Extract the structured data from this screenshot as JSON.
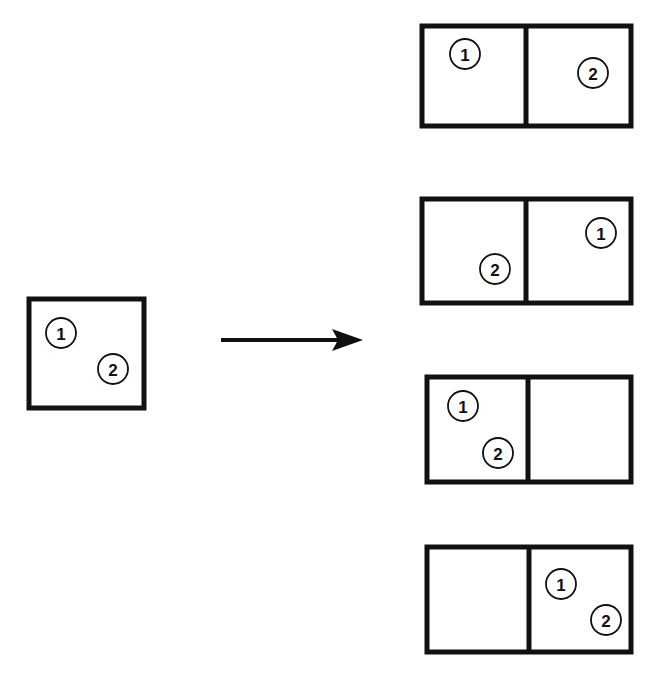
{
  "diagram": {
    "type": "state-transition",
    "source": {
      "label": "single-cell",
      "particles": [
        {
          "id": "1",
          "label": "1",
          "cx": 61,
          "cy": 333
        },
        {
          "id": "2",
          "label": "2",
          "cx": 113,
          "cy": 369
        }
      ]
    },
    "arrow": {
      "from": "source",
      "to": "outcomes",
      "direction": "right"
    },
    "outcomes": [
      {
        "index": 1,
        "left_cell": [
          "1"
        ],
        "right_cell": [
          "2"
        ],
        "particles": [
          {
            "label": "1",
            "cx": 465,
            "cy": 54
          },
          {
            "label": "2",
            "cx": 593,
            "cy": 73
          }
        ]
      },
      {
        "index": 2,
        "left_cell": [
          "2"
        ],
        "right_cell": [
          "1"
        ],
        "particles": [
          {
            "label": "1",
            "cx": 601,
            "cy": 233
          },
          {
            "label": "2",
            "cx": 495,
            "cy": 269
          }
        ]
      },
      {
        "index": 3,
        "left_cell": [
          "1",
          "2"
        ],
        "right_cell": [],
        "particles": [
          {
            "label": "1",
            "cx": 463,
            "cy": 406
          },
          {
            "label": "2",
            "cx": 498,
            "cy": 453
          }
        ]
      },
      {
        "index": 4,
        "left_cell": [],
        "right_cell": [
          "1",
          "2"
        ],
        "particles": [
          {
            "label": "1",
            "cx": 561,
            "cy": 584
          },
          {
            "label": "2",
            "cx": 606,
            "cy": 620
          }
        ]
      }
    ]
  },
  "labels": {
    "one": "1",
    "two": "2"
  },
  "colors": {
    "stroke": "#111111",
    "background": "#ffffff"
  }
}
